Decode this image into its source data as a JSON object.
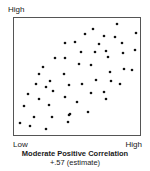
{
  "chart_data": {
    "type": "scatter",
    "title": "Moderate  Positive Correlation",
    "subtitle": "+.57 (estimate)",
    "xlabel": "",
    "ylabel": "",
    "x_tick_labels": {
      "min": "Low",
      "max": "High"
    },
    "y_tick_labels": {
      "max": "High"
    },
    "xlim": [
      0,
      126
    ],
    "ylim": [
      0,
      117
    ],
    "grid": false,
    "legend": null,
    "correlation_estimate": 0.57,
    "marker_color": "#111111",
    "points": [
      {
        "x": 103,
        "y": 111
      },
      {
        "x": 79,
        "y": 106
      },
      {
        "x": 122,
        "y": 102
      },
      {
        "x": 71,
        "y": 101
      },
      {
        "x": 90,
        "y": 99
      },
      {
        "x": 101,
        "y": 98
      },
      {
        "x": 61,
        "y": 93
      },
      {
        "x": 51,
        "y": 92
      },
      {
        "x": 85,
        "y": 91
      },
      {
        "x": 108,
        "y": 92
      },
      {
        "x": 121,
        "y": 85
      },
      {
        "x": 67,
        "y": 83
      },
      {
        "x": 81,
        "y": 83
      },
      {
        "x": 92,
        "y": 84
      },
      {
        "x": 109,
        "y": 82
      },
      {
        "x": 94,
        "y": 78
      },
      {
        "x": 41,
        "y": 77
      },
      {
        "x": 51,
        "y": 77
      },
      {
        "x": 29,
        "y": 68
      },
      {
        "x": 65,
        "y": 71
      },
      {
        "x": 77,
        "y": 70
      },
      {
        "x": 110,
        "y": 66
      },
      {
        "x": 118,
        "y": 65
      },
      {
        "x": 25,
        "y": 61
      },
      {
        "x": 50,
        "y": 61
      },
      {
        "x": 96,
        "y": 63
      },
      {
        "x": 36,
        "y": 54
      },
      {
        "x": 82,
        "y": 55
      },
      {
        "x": 97,
        "y": 54
      },
      {
        "x": 22,
        "y": 51
      },
      {
        "x": 32,
        "y": 48
      },
      {
        "x": 55,
        "y": 50
      },
      {
        "x": 68,
        "y": 51
      },
      {
        "x": 106,
        "y": 51
      },
      {
        "x": 39,
        "y": 44
      },
      {
        "x": 14,
        "y": 41
      },
      {
        "x": 77,
        "y": 42
      },
      {
        "x": 90,
        "y": 43
      },
      {
        "x": 51,
        "y": 38
      },
      {
        "x": 25,
        "y": 36
      },
      {
        "x": 92,
        "y": 36
      },
      {
        "x": 63,
        "y": 33
      },
      {
        "x": 35,
        "y": 30
      },
      {
        "x": 10,
        "y": 29
      },
      {
        "x": 74,
        "y": 23
      },
      {
        "x": 56,
        "y": 21
      },
      {
        "x": 55,
        "y": 20
      },
      {
        "x": 20,
        "y": 18
      },
      {
        "x": 38,
        "y": 18
      },
      {
        "x": 6,
        "y": 12
      },
      {
        "x": 54,
        "y": 13
      },
      {
        "x": 16,
        "y": 9
      },
      {
        "x": 32,
        "y": 6
      }
    ]
  }
}
